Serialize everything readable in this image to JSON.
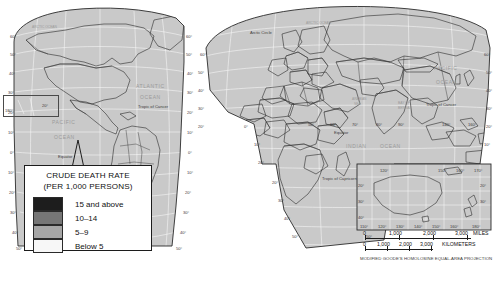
{
  "map": {
    "title_hidden": "",
    "projection_note": "MODIFIED GOODE'S HOMOLOSINE EQUAL-AREA PROJECTION",
    "labels": {
      "arctic_circle": "Arctic Circle",
      "equator_west": "Equator",
      "equator_east": "Equator",
      "tropic_cancer_west": "Tropic of Cancer",
      "tropic_cancer_east": "Tropic of Cancer",
      "tropic_capricorn": "Tropic of Capricorn",
      "atlantic": "ATLANTIC",
      "atlantic2": "OCEAN",
      "pacific_west": "PACIFIC",
      "pacific_west2": "OCEAN",
      "pacific_east": "PACIFIC",
      "pacific_east2": "OCEAN",
      "indian": "INDIAN",
      "indian2": "OCEAN",
      "arctic_ocean": "ARCTIC OCEAN",
      "arctic_ocean_east": "ARCTIC OCEAN",
      "arabian_sea": "ARABIAN SEA",
      "bay_of_bengal": "BAY OF BENGAL",
      "lon180": "180°"
    },
    "lat_left": [
      "60°",
      "50°",
      "40°",
      "30°",
      "20°",
      "10°",
      "0°",
      "10°",
      "20°",
      "30°",
      "40°",
      "50°"
    ],
    "lat_west_right": [
      "60°",
      "50°",
      "40°",
      "30°",
      "20°",
      "10°",
      "0°",
      "10°",
      "20°",
      "30°",
      "40°",
      "50°"
    ],
    "lat_east_left": [
      "60°",
      "50°",
      "40°",
      "30°",
      "20°",
      "10°",
      "0°",
      "10°",
      "20°",
      "30°",
      "40°",
      "50°"
    ],
    "lat_east_right": [
      "60°",
      "50°",
      "40°",
      "30°",
      "20°",
      "10°",
      "20°",
      "30°",
      "40°",
      "50°"
    ],
    "lon_east_equator": [
      "50°",
      "60°",
      "70°",
      "80°",
      "90°"
    ],
    "lon_east_low": [
      "140°",
      "160°"
    ]
  },
  "legend": {
    "title_line1": "CRUDE DEATH RATE",
    "title_line2": "(PER 1,000 PERSONS)",
    "classes": [
      {
        "label": "15 and above",
        "color": "#1d1d1d"
      },
      {
        "label": "10–14",
        "color": "#767676"
      },
      {
        "label": "5–9",
        "color": "#a6a6a6"
      },
      {
        "label": "Below 5",
        "color": "#f7f7f7"
      }
    ]
  },
  "inset": {
    "name": "australia-inset",
    "lon_top": [
      "120°",
      "150°",
      "160°",
      "170°"
    ],
    "lon_bottom": [
      "110°",
      "120°",
      "130°",
      "140°",
      "150°",
      "160°",
      "180°"
    ],
    "lat_left": [
      "20°",
      "30°",
      "40°"
    ],
    "lat_right": [
      "20°",
      "30°"
    ]
  },
  "scale": {
    "miles": {
      "values": [
        "0",
        "1,000",
        "2,000",
        "3,000"
      ],
      "unit": "MILES"
    },
    "kilometers": {
      "values": [
        "0",
        "1,000",
        "2,000",
        "3,000"
      ],
      "unit": "KILOMETERS"
    }
  }
}
